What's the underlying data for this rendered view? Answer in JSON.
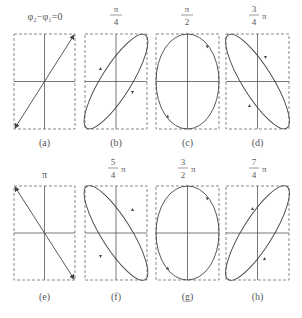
{
  "figure": {
    "panels": [
      {
        "id": "a",
        "label": "(a)",
        "phase_text": "φ₂−φ₁=0",
        "phase_num": "",
        "phase_den": "",
        "phase_suffix": "",
        "shape": "line-pos",
        "rx": 0,
        "ry": 0,
        "angle": 0
      },
      {
        "id": "b",
        "label": "(b)",
        "phase_text": "",
        "phase_num": "π",
        "phase_den": "4",
        "phase_suffix": "",
        "shape": "ellipse",
        "angle": -58
      },
      {
        "id": "c",
        "label": "(c)",
        "phase_text": "",
        "phase_num": "π",
        "phase_den": "2",
        "phase_suffix": "",
        "shape": "ellipse",
        "angle": 90
      },
      {
        "id": "d",
        "label": "(d)",
        "phase_text": "",
        "phase_num": "3",
        "phase_den": "4",
        "phase_suffix": "π",
        "shape": "ellipse",
        "angle": 58
      },
      {
        "id": "e",
        "label": "(e)",
        "phase_text": "π",
        "phase_num": "",
        "phase_den": "",
        "phase_suffix": "",
        "shape": "line-neg",
        "angle": 0
      },
      {
        "id": "f",
        "label": "(f)",
        "phase_text": "",
        "phase_num": "5",
        "phase_den": "4",
        "phase_suffix": "π",
        "shape": "ellipse",
        "angle": 58
      },
      {
        "id": "g",
        "label": "(g)",
        "phase_text": "",
        "phase_num": "3",
        "phase_den": "2",
        "phase_suffix": "π",
        "shape": "ellipse",
        "angle": 90
      },
      {
        "id": "h",
        "label": "(h)",
        "phase_text": "",
        "phase_num": "7",
        "phase_den": "4",
        "phase_suffix": "π",
        "shape": "ellipse",
        "angle": -58
      }
    ],
    "colors": {
      "stroke": "#444444",
      "dashed": "#888888",
      "axis": "#555555"
    }
  }
}
